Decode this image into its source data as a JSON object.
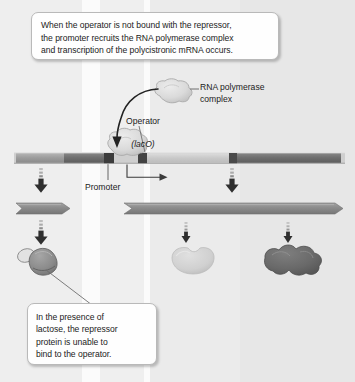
{
  "figure": {
    "width": 355,
    "height": 382,
    "background": "#fdfdfd"
  },
  "callouts": [
    {
      "id": "top",
      "text": "When the operator is not bound with the repressor,\nthe promoter recruits the RNA polymerase complex\nand transcription of the polycistronic mRNA occurs."
    },
    {
      "id": "bottom",
      "text": "In the presence of\nlactose, the repressor\nprotein is unable to\nbind to the operator."
    }
  ],
  "labels": {
    "rna_polymerase": "RNA polymerase\ncomplex",
    "operator": "Operator",
    "operator_gene": "(lacO)",
    "promoter": "Promoter"
  },
  "colors": {
    "callout_border": "#b9b9b9",
    "callout_fill": "#fefefe",
    "text": "#1b1b1b",
    "leader_line": "#6e6e6e",
    "dna_backbone": "#cfcfcf",
    "dna_segment_light": "#9a9a9a",
    "dna_segment_mid": "#7f7f7f",
    "dna_segment_dark": "#5a5a5a",
    "dna_segment_darkest": "#3d3d3d",
    "operator_marker": "#4a4a4a",
    "rnap_blob": "#dcdcdc",
    "rnap_blob_stroke": "#a9a9a9",
    "mrna_arrow": "#8e8e8e",
    "arrow_dark": "#2f2f2f",
    "protein_light": "#d2d2d2",
    "protein_mid": "#8c8c8c",
    "protein_dark": "#6b6b6b",
    "column_a": "#f1f1f1",
    "column_b": "#e9e9e9",
    "column_c": "#ededed"
  },
  "columns": [
    {
      "name": "lacI-column",
      "x": 0,
      "width": 82,
      "fill": "#eeeeee"
    },
    {
      "name": "gap-column-1",
      "x": 82,
      "width": 18,
      "fill": "#fbfbfb"
    },
    {
      "name": "promoter-operator-column",
      "x": 100,
      "width": 44,
      "fill": "#efefef"
    },
    {
      "name": "gap-column-2",
      "x": 144,
      "width": 6,
      "fill": "#fbfbfb"
    },
    {
      "name": "lacZ-column",
      "x": 150,
      "width": 90,
      "fill": "#ebebeb"
    },
    {
      "name": "lacY-column",
      "x": 240,
      "width": 115,
      "fill": "#e7e7e7"
    }
  ],
  "dna": {
    "y": 152,
    "height": 12,
    "backbone_fill": "#cfcfcf",
    "segments": [
      {
        "name": "lacI-gene",
        "x": 16,
        "width": 48,
        "fill": "#9a9a9a"
      },
      {
        "name": "lacI-gene-dark",
        "x": 64,
        "width": 40,
        "fill": "#6e6e6e"
      },
      {
        "name": "promoter-segment",
        "x": 104,
        "width": 10,
        "fill": "#3f3f3f"
      },
      {
        "name": "operator-marker",
        "x": 138,
        "width": 9,
        "fill": "#434343"
      },
      {
        "name": "lacZ-gene",
        "x": 147,
        "width": 82,
        "fill": "#c6c6c6"
      },
      {
        "name": "lacY-start-marker",
        "x": 229,
        "width": 8,
        "fill": "#4a4a4a"
      },
      {
        "name": "lacY-gene",
        "x": 237,
        "width": 104,
        "fill": "#6e6e6e"
      }
    ]
  },
  "transcription_arrow": {
    "name": "transcription-start-arrow",
    "origin_x": 127,
    "origin_y": 168,
    "tip_x": 165,
    "tip_y": 178
  },
  "mrna_arrows": [
    {
      "name": "lacI-mrna",
      "x": 16,
      "width": 54,
      "y": 203,
      "height": 11,
      "fill": "#8e8e8e"
    },
    {
      "name": "polycistronic-mrna",
      "x": 124,
      "width": 219,
      "y": 203,
      "height": 11,
      "fill": "#8e8e8e"
    }
  ],
  "down_arrows": [
    {
      "name": "down-arrow-lacI-transcription",
      "x": 41,
      "y": 172,
      "size": "large"
    },
    {
      "name": "down-arrow-lacZ-transcription",
      "x": 232,
      "y": 172,
      "size": "large"
    },
    {
      "name": "down-arrow-lacI-translation",
      "x": 41,
      "y": 224,
      "size": "large"
    },
    {
      "name": "down-arrow-lacZ-translation",
      "x": 186,
      "y": 224,
      "size": "small"
    },
    {
      "name": "down-arrow-lacY-translation",
      "x": 288,
      "y": 224,
      "size": "small"
    }
  ],
  "proteins": [
    {
      "name": "repressor-protein-with-lactose",
      "x": 20,
      "y": 246,
      "fill": "#8c8c8c",
      "note": "repressor bound to lactose, unable to bind operator"
    },
    {
      "name": "beta-galactosidase-protein",
      "x": 172,
      "y": 248,
      "fill": "#d2d2d2"
    },
    {
      "name": "permease-protein",
      "x": 265,
      "y": 246,
      "fill": "#6b6b6b"
    }
  ],
  "rna_polymerase": {
    "name": "rna-polymerase-complex-blob",
    "docked_x": 112,
    "docked_y": 136,
    "free_x": 158,
    "free_y": 82,
    "fill": "#dcdcdc",
    "stroke": "#a9a9a9"
  }
}
